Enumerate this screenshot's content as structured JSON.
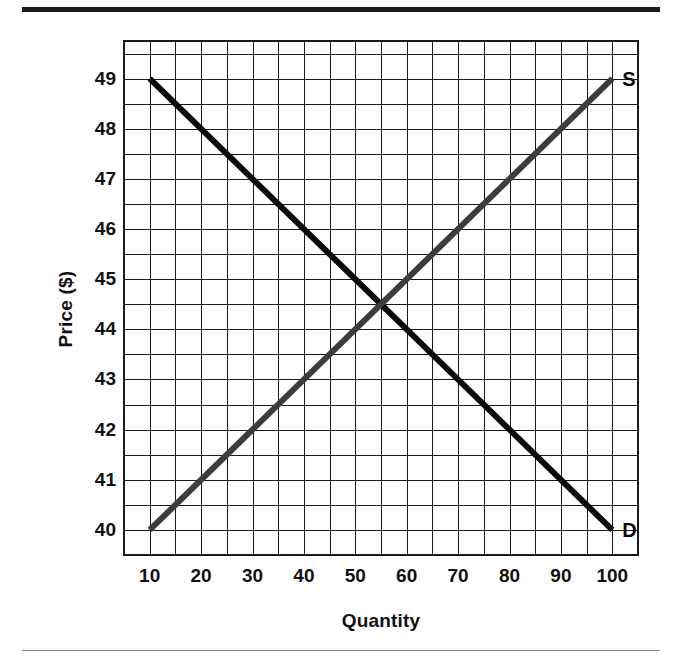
{
  "figure": {
    "background_color": "#ffffff",
    "top_rule_color": "#1b1b1b",
    "bottom_rule_color": "#8c8c8c"
  },
  "chart_data": {
    "type": "line",
    "title": "",
    "subtitle": "",
    "xlabel": "Quantity",
    "ylabel": "Price ($)",
    "xlim": [
      5,
      105
    ],
    "ylim": [
      39.5,
      49.75
    ],
    "xticks": [
      10,
      20,
      30,
      40,
      50,
      60,
      70,
      80,
      90,
      100
    ],
    "xtick_labels": [
      "10",
      "20",
      "30",
      "40",
      "50",
      "60",
      "70",
      "80",
      "90",
      "100"
    ],
    "yticks": [
      40,
      41,
      42,
      43,
      44,
      45,
      46,
      47,
      48,
      49
    ],
    "ytick_labels": [
      "40",
      "41",
      "42",
      "43",
      "44",
      "45",
      "46",
      "47",
      "48",
      "49"
    ],
    "grid": true,
    "grid_major_color": "#1a1a1a",
    "grid_minor_color": "#1a1a1a",
    "grid_minor_x_step": 5,
    "grid_minor_y_step": 0.5,
    "legend": "none",
    "legend_position": "inline-end-labels",
    "series": [
      {
        "name": "D",
        "label": "D",
        "description": "Demand curve, downward sloping",
        "color": "#0a0a0a",
        "line_width": 6,
        "x": [
          10,
          100
        ],
        "values": [
          49,
          40
        ],
        "endpoint_label_x": 100,
        "endpoint_label_y": 40
      },
      {
        "name": "S",
        "label": "S",
        "description": "Supply curve, upward sloping",
        "color": "#3c3c3c",
        "line_width": 6,
        "x": [
          10,
          100
        ],
        "values": [
          40,
          49
        ],
        "endpoint_label_x": 100,
        "endpoint_label_y": 49
      }
    ],
    "annotations": [
      {
        "name": "equilibrium",
        "x": 55,
        "y": 44.5,
        "text": ""
      }
    ]
  }
}
